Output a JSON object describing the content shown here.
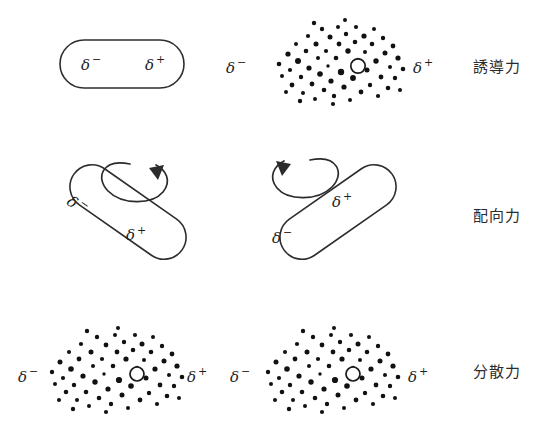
{
  "figure": {
    "title": "",
    "background_color": "#ffffff",
    "ink_color": "#1f1f1f",
    "width": 537,
    "height": 444,
    "rows": [
      {
        "id": "induction",
        "label": "誘導力",
        "left_object": {
          "kind": "capsule",
          "rotation_deg": 0,
          "charges": [
            {
              "symbol": "δ",
              "sign": "−"
            },
            {
              "symbol": "δ",
              "sign": "+"
            }
          ]
        },
        "right_object": {
          "kind": "electron-cloud",
          "charges": [
            {
              "symbol": "δ",
              "sign": "−"
            },
            {
              "symbol": "δ",
              "sign": "+"
            }
          ]
        },
        "rotation_arrow": false
      },
      {
        "id": "orientation",
        "label": "配向力",
        "left_object": {
          "kind": "capsule",
          "rotation_deg": 35,
          "charges": [
            {
              "symbol": "δ",
              "sign": "−"
            },
            {
              "symbol": "δ",
              "sign": "+"
            }
          ]
        },
        "right_object": {
          "kind": "capsule",
          "rotation_deg": -35,
          "charges": [
            {
              "symbol": "δ",
              "sign": "+"
            },
            {
              "symbol": "δ",
              "sign": "−"
            }
          ]
        },
        "rotation_arrow": true
      },
      {
        "id": "dispersion",
        "label": "分散力",
        "left_object": {
          "kind": "electron-cloud",
          "charges": [
            {
              "symbol": "δ",
              "sign": "−"
            },
            {
              "symbol": "δ",
              "sign": "+"
            }
          ]
        },
        "right_object": {
          "kind": "electron-cloud",
          "charges": [
            {
              "symbol": "δ",
              "sign": "−"
            },
            {
              "symbol": "δ",
              "sign": "+"
            }
          ]
        },
        "rotation_arrow": false
      }
    ],
    "symbols": {
      "delta": "δ",
      "minus": "−",
      "plus": "+"
    }
  }
}
